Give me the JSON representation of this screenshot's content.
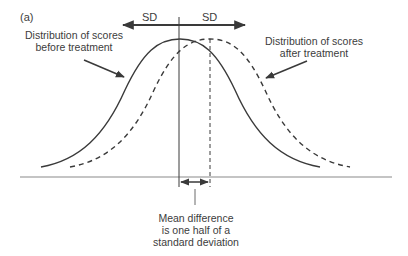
{
  "figure": {
    "panel_label": "(a)",
    "sd_left_label": "SD",
    "sd_right_label": "SD",
    "before_label_line1": "Distribution of scores",
    "before_label_line2": "before treatment",
    "after_label_line1": "Distribution of scores",
    "after_label_line2": "after treatment",
    "mean_label_line1": "Mean difference",
    "mean_label_line2": "is one half of a",
    "mean_label_line3": "standard deviation"
  },
  "colors": {
    "line": "#3a3a3a",
    "axis": "#8a8a8a"
  }
}
